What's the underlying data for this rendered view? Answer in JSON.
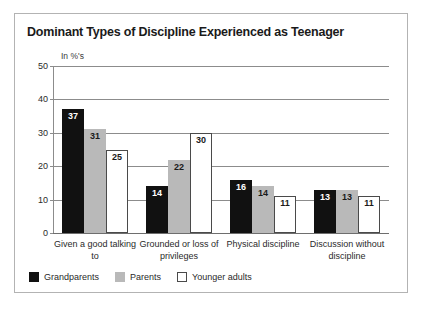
{
  "figure": {
    "title": "Dominant Types of Discipline Experienced as Teenager",
    "unit_label": "In %'s"
  },
  "chart_data": {
    "type": "bar",
    "title": "Dominant Types of Discipline Experienced as Teenager",
    "subtitle": "",
    "xlabel": "",
    "ylabel": "In %'s",
    "ylim": [
      0,
      50
    ],
    "yticks": [
      0,
      10,
      20,
      30,
      40,
      50
    ],
    "grid": true,
    "legend_position": "bottom-left",
    "categories": [
      "Given a good talking to",
      "Grounded or loss of privileges",
      "Physical discipline",
      "Discussion without discipline"
    ],
    "series": [
      {
        "name": "Grandparents",
        "color": "#111111",
        "values": [
          37,
          14,
          16,
          13
        ]
      },
      {
        "name": "Parents",
        "color": "#b9b9b9",
        "values": [
          31,
          22,
          14,
          13
        ]
      },
      {
        "name": "Younger adults",
        "color": "#ffffff",
        "values": [
          25,
          30,
          11,
          11
        ]
      }
    ]
  }
}
